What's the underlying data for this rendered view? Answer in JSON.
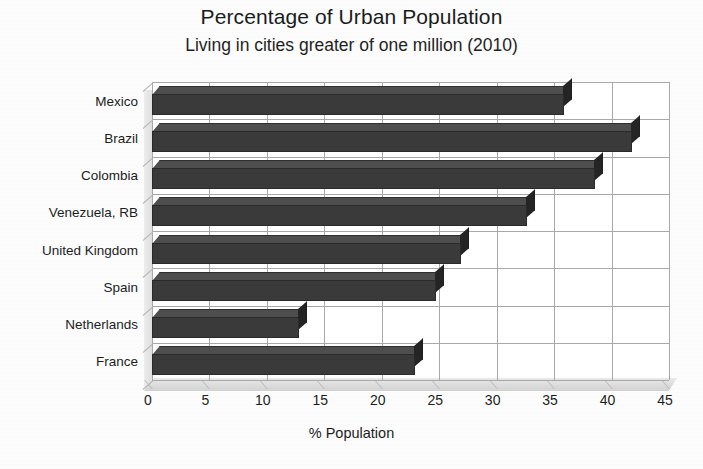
{
  "chart_data": {
    "type": "bar",
    "orientation": "horizontal",
    "title": "Percentage of Urban Population",
    "subtitle": "Living in cities greater of one million (2010)",
    "xlabel": "% Population",
    "ylabel": "",
    "categories": [
      "Mexico",
      "Brazil",
      "Colombia",
      "Venezuela, RB",
      "United Kingdom",
      "Spain",
      "Netherlands",
      "France"
    ],
    "values": [
      35.9,
      41.8,
      38.6,
      32.6,
      26.9,
      24.7,
      12.8,
      22.9
    ],
    "xlim": [
      0,
      45
    ],
    "xticks": [
      0,
      5,
      10,
      15,
      20,
      25,
      30,
      35,
      40,
      45
    ],
    "xtick_labels": [
      "0",
      "5",
      "10",
      "15",
      "20",
      "25",
      "30",
      "35",
      "40",
      "45"
    ],
    "grid": true,
    "grid_axis": "x",
    "legend": false,
    "style": "3d-bar-grayscale",
    "bar_color": "#3a3a3a",
    "grid_color": "#a8a8a8",
    "background_color": "#ffffff"
  },
  "figure": {
    "caption_fragment": ""
  }
}
